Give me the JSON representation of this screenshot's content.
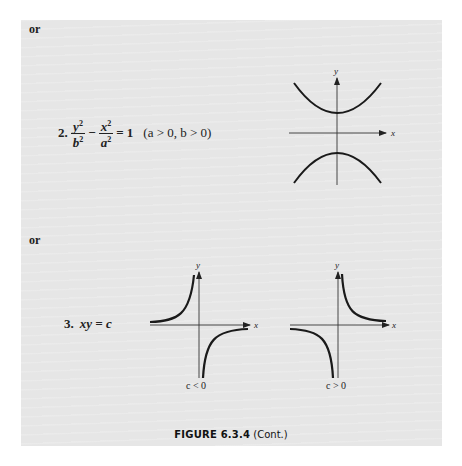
{
  "page": {
    "or_label_1": "or",
    "or_label_2": "or",
    "item2": {
      "number": "2.",
      "term1_num": "y",
      "term1_den": "b",
      "minus": "−",
      "term2_num": "x",
      "term2_den": "a",
      "exp": "2",
      "rhs": "= 1",
      "condition": "(a > 0, b > 0)"
    },
    "item3": {
      "number": "3.",
      "equation": "xy = c",
      "left_condition": "c < 0",
      "right_condition": "c > 0"
    },
    "axis_labels": {
      "x": "x",
      "y": "y"
    },
    "caption": {
      "figure": "FIGURE 6.3.4",
      "suffix": "(Cont.)"
    }
  },
  "figures": [
    {
      "id": "hyperbola-vertical",
      "type": "hyperbola",
      "equation": "y^2/b^2 - x^2/a^2 = 1",
      "branches": [
        "upper",
        "lower"
      ]
    },
    {
      "id": "rectangular-hyperbola-neg",
      "type": "hyperbola",
      "equation": "xy = c",
      "condition": "c < 0",
      "quadrants": [
        "II",
        "IV"
      ]
    },
    {
      "id": "rectangular-hyperbola-pos",
      "type": "hyperbola",
      "equation": "xy = c",
      "condition": "c > 0",
      "quadrants": [
        "I",
        "III"
      ]
    }
  ]
}
